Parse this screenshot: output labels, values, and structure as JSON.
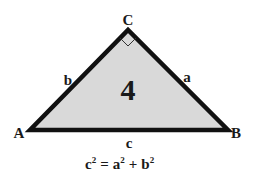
{
  "diagram": {
    "vertices": {
      "A": {
        "label": "A",
        "x": 30,
        "y": 130
      },
      "B": {
        "label": "B",
        "x": 228,
        "y": 130
      },
      "C": {
        "label": "C",
        "x": 128,
        "y": 30
      }
    },
    "sides": {
      "a": {
        "label": "a"
      },
      "b": {
        "label": "b"
      },
      "c": {
        "label": "c"
      }
    },
    "center_label": "4",
    "right_angle_at": "C",
    "formula": {
      "c": "c",
      "exp1": "2",
      "eq": "=",
      "a": "a",
      "exp2": "2",
      "plus": "+",
      "b": "b",
      "exp3": "2"
    },
    "colors": {
      "fill": "#d9d9d9",
      "stroke": "#111111",
      "text": "#1a1a1a"
    }
  }
}
